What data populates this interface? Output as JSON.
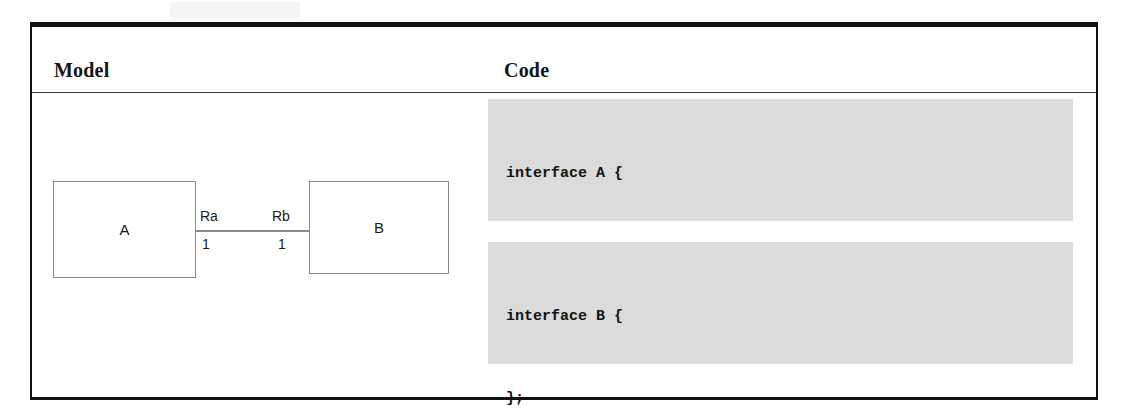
{
  "figure": {
    "columns": {
      "model_header": "Model",
      "code_header": "Code"
    },
    "model_diagram": {
      "type": "uml-class-association",
      "class_a_label": "A",
      "class_b_label": "B",
      "role_a_label": "Ra",
      "role_b_label": "Rb",
      "multiplicity_a": "1",
      "multiplicity_b": "1",
      "line_color": "#8a8a8a",
      "box_border_color": "#8a8a8a"
    },
    "code_blocks": [
      {
        "name": "interface-a-block",
        "background": "#dbdbdb",
        "lines": [
          "interface A {",
          "",
          "    attribute B Rb;",
          "};"
        ]
      },
      {
        "name": "interface-b-block",
        "background": "#dbdbdb",
        "lines": [
          "interface B {",
          "",
          "    attribute A Ra;",
          "};"
        ]
      }
    ]
  }
}
